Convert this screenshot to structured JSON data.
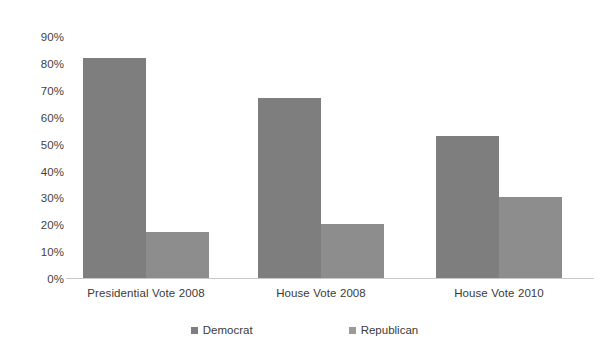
{
  "chart_data": {
    "type": "bar",
    "title": "",
    "subtitle": "",
    "xlabel": "",
    "ylabel": "",
    "categories": [
      "Presidential Vote 2008",
      "House Vote 2008",
      "House Vote 2010"
    ],
    "series": [
      {
        "name": "Democrat",
        "values": [
          82,
          67,
          53
        ],
        "color": "#7e7e7e"
      },
      {
        "name": "Republican",
        "values": [
          17,
          20,
          30
        ],
        "color": "#8d8d8d"
      }
    ],
    "ylim": [
      0,
      90
    ],
    "ytick_values": [
      0,
      10,
      20,
      30,
      40,
      50,
      60,
      70,
      80,
      90
    ],
    "ytick_labels": [
      "0%",
      "10%",
      "20%",
      "30%",
      "40%",
      "50%",
      "60%",
      "70%",
      "80%",
      "90%"
    ],
    "grid": false,
    "legend_position": "bottom",
    "value_format": "percent",
    "background_color": "#ffffff",
    "axis_color": "#c8c8c8"
  },
  "axis": {
    "y_labels": [
      {
        "text": "90%",
        "value": 90
      },
      {
        "text": "80%",
        "value": 80
      },
      {
        "text": "70%",
        "value": 70
      },
      {
        "text": "60%",
        "value": 60
      },
      {
        "text": "50%",
        "value": 50
      },
      {
        "text": "40%",
        "value": 40
      },
      {
        "text": "30%",
        "value": 30
      },
      {
        "text": "20%",
        "value": 20
      },
      {
        "text": "10%",
        "value": 10
      },
      {
        "text": "0%",
        "value": 0
      }
    ],
    "x_labels": [
      {
        "text": "Presidential Vote 2008"
      },
      {
        "text": "House Vote 2008"
      },
      {
        "text": "House Vote 2010"
      }
    ]
  },
  "legend": {
    "entries": [
      {
        "label": "Democrat",
        "color": "#7e7e7e"
      },
      {
        "label": "Republican",
        "color": "#9a9a9a"
      }
    ]
  }
}
